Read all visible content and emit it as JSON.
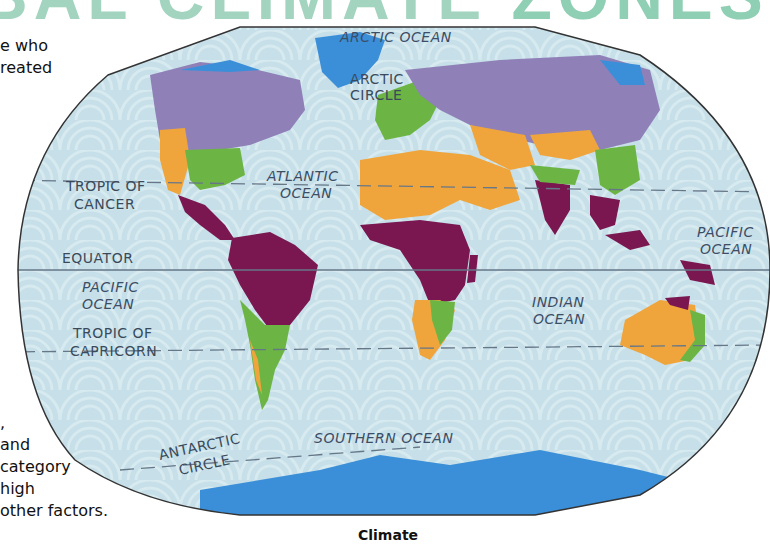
{
  "header": {
    "title_part1": "BAL CLIMATE ",
    "title_part2": "ZONES"
  },
  "side_text": {
    "top_lines": [
      "e who",
      "reated"
    ],
    "bottom_lines": [
      ",",
      " and",
      "category",
      "high",
      "other factors."
    ]
  },
  "map": {
    "ocean_labels": {
      "arctic": "ARCTIC OCEAN",
      "atlantic": [
        "ATLANTIC",
        "OCEAN"
      ],
      "pacific_west": [
        "PACIFIC",
        "OCEAN"
      ],
      "pacific_east": [
        "PACIFIC",
        "OCEAN"
      ],
      "indian": [
        "INDIAN",
        "OCEAN"
      ],
      "southern": "SOUTHERN OCEAN"
    },
    "line_labels": {
      "arctic_circle": [
        "ARCTIC",
        "CIRCLE"
      ],
      "tropic_of_cancer": [
        "TROPIC OF",
        "CANCER"
      ],
      "equator": "EQUATOR",
      "tropic_of_capricorn": [
        "TROPIC OF",
        "CAPRICORN"
      ],
      "antarctic_circle": [
        "ANTARCTIC",
        "CIRCLE"
      ]
    },
    "climate_colors": {
      "polar": "#3b8fd9",
      "cold_continental": "#8f80b8",
      "temperate": "#6cb544",
      "dry": "#f0a53c",
      "tropical": "#7a1750",
      "ocean": "#c6dfe8"
    }
  },
  "caption": "Climate"
}
